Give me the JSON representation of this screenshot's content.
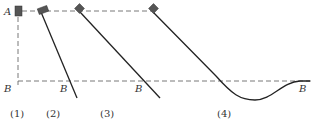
{
  "diagram": {
    "labels": {
      "A": "A",
      "B_left": "B",
      "B_2": "B",
      "B_3": "B",
      "B_4": "B"
    },
    "captions": [
      "(1)",
      "(2)",
      "(3)",
      "(4)"
    ],
    "colors": {
      "block": "#555555",
      "line": "#222222",
      "dash": "#555555"
    }
  }
}
